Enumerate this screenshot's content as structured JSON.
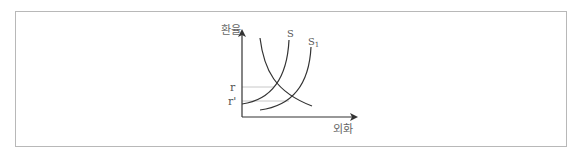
{
  "diagram": {
    "type": "supply-demand",
    "y_axis_label": "환율",
    "x_axis_label": "외화",
    "curves": [
      {
        "name": "D",
        "label": "",
        "shape": "downward"
      },
      {
        "name": "S",
        "label": "S",
        "shape": "upward"
      },
      {
        "name": "S1",
        "label": "S",
        "subscript": "1",
        "shape": "upward"
      }
    ],
    "y_ticks": [
      {
        "label": "r",
        "level": "original equilibrium"
      },
      {
        "label": "r'",
        "level": "new equilibrium"
      }
    ],
    "colors": {
      "curve": "#333333",
      "guide": "#bbbbbb",
      "border": "#b8b8b8",
      "text": "#555555"
    }
  }
}
